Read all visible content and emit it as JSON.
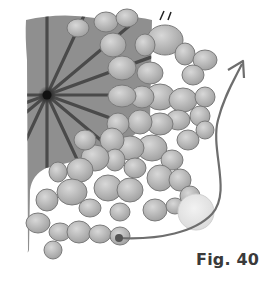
{
  "caption": "Fig. 40",
  "colors": {
    "background": "#ffffff",
    "sheet": "#8f8f8f",
    "spoke": "#4a4a4a",
    "hub": "#1a1a1a",
    "cell_fill": "#b8b8b8",
    "cell_edge": "#7a7a7a",
    "arrow": "#6e6e6e",
    "ghost_cell": "#e6e6e6",
    "caption": "#3a3a3a"
  },
  "hub": {
    "x": 47,
    "y": 95
  },
  "spokes_angles_deg": [
    -90,
    -65,
    -40,
    -20,
    0,
    20,
    40,
    65,
    90,
    115,
    140,
    160,
    180
  ],
  "cells": [
    [
      78,
      28,
      11,
      9
    ],
    [
      106,
      22,
      12,
      10
    ],
    [
      127,
      18,
      11,
      9
    ],
    [
      165,
      40,
      18,
      15
    ],
    [
      145,
      45,
      10,
      11
    ],
    [
      113,
      45,
      13,
      12
    ],
    [
      122,
      68,
      14,
      12
    ],
    [
      150,
      73,
      13,
      11
    ],
    [
      185,
      54,
      10,
      11
    ],
    [
      205,
      60,
      12,
      10
    ],
    [
      193,
      75,
      11,
      10
    ],
    [
      160,
      97,
      15,
      13
    ],
    [
      142,
      97,
      12,
      11
    ],
    [
      122,
      96,
      14,
      11
    ],
    [
      183,
      100,
      14,
      12
    ],
    [
      205,
      97,
      10,
      10
    ],
    [
      200,
      116,
      10,
      10
    ],
    [
      178,
      120,
      12,
      10
    ],
    [
      160,
      124,
      13,
      11
    ],
    [
      140,
      122,
      12,
      12
    ],
    [
      118,
      124,
      11,
      11
    ],
    [
      152,
      148,
      15,
      13
    ],
    [
      130,
      148,
      14,
      12
    ],
    [
      112,
      140,
      12,
      12
    ],
    [
      188,
      140,
      11,
      10
    ],
    [
      205,
      130,
      9,
      9
    ],
    [
      172,
      160,
      11,
      10
    ],
    [
      135,
      168,
      11,
      10
    ],
    [
      115,
      160,
      10,
      11
    ],
    [
      95,
      158,
      14,
      13
    ],
    [
      80,
      170,
      13,
      12
    ],
    [
      58,
      172,
      9,
      10
    ],
    [
      85,
      140,
      11,
      10
    ],
    [
      108,
      188,
      14,
      13
    ],
    [
      130,
      190,
      13,
      12
    ],
    [
      160,
      178,
      13,
      13
    ],
    [
      180,
      180,
      11,
      11
    ],
    [
      155,
      210,
      12,
      11
    ],
    [
      175,
      206,
      9,
      8
    ],
    [
      190,
      196,
      10,
      10
    ],
    [
      120,
      212,
      10,
      9
    ],
    [
      90,
      208,
      11,
      9
    ],
    [
      72,
      192,
      15,
      13
    ],
    [
      47,
      200,
      11,
      11
    ],
    [
      38,
      223,
      12,
      10
    ],
    [
      60,
      232,
      11,
      9
    ],
    [
      79,
      232,
      12,
      11
    ],
    [
      100,
      234,
      11,
      9
    ],
    [
      120,
      236,
      10,
      9
    ],
    [
      53,
      250,
      9,
      9
    ]
  ],
  "ghost_cell": {
    "x": 196,
    "y": 212,
    "r": 18
  },
  "arrow": {
    "start": [
      119,
      238
    ],
    "tip": [
      242,
      63
    ]
  }
}
